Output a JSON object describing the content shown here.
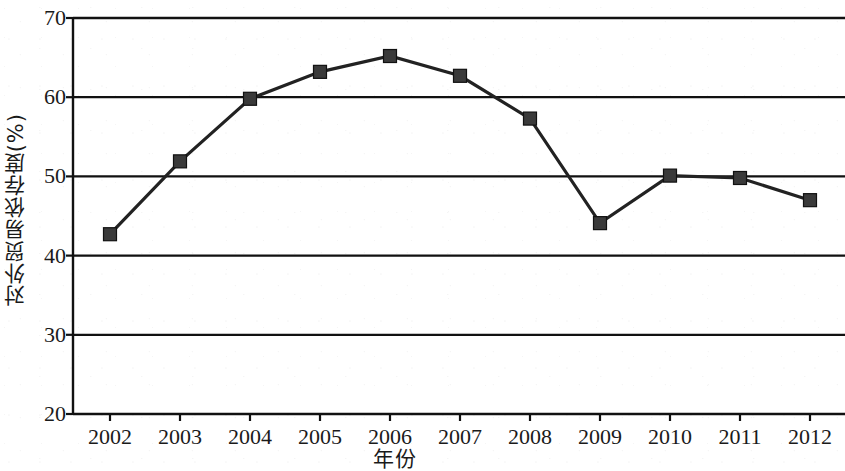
{
  "chart_data": {
    "type": "line",
    "title": "",
    "subtitle": "",
    "xlabel": "年份",
    "ylabel": "对外贸易依存度(%)",
    "categories": [
      "2002",
      "2003",
      "2004",
      "2005",
      "2006",
      "2007",
      "2008",
      "2009",
      "2010",
      "2011",
      "2012"
    ],
    "x": [
      2002,
      2003,
      2004,
      2005,
      2006,
      2007,
      2008,
      2009,
      2010,
      2011,
      2012
    ],
    "values": [
      42.7,
      51.9,
      59.8,
      63.2,
      65.2,
      62.7,
      57.3,
      44.1,
      50.1,
      49.8,
      47.0
    ],
    "series": [
      {
        "name": "对外贸易依存度",
        "values": [
          42.7,
          51.9,
          59.8,
          63.2,
          65.2,
          62.7,
          57.3,
          44.1,
          50.1,
          49.8,
          47.0
        ]
      }
    ],
    "ylim": [
      20,
      70
    ],
    "yticks": [
      20,
      30,
      40,
      50,
      60,
      70
    ],
    "ytick_labels": [
      "20",
      "30",
      "40",
      "50",
      "60",
      "70"
    ],
    "xlim": [
      2002,
      2012
    ],
    "grid": "horizontal",
    "legend": "none",
    "marker": "square",
    "line_color": "#222222",
    "marker_color": "#3a3a3a",
    "axis_color": "#111111",
    "background_color": "#ffffff"
  },
  "axis": {
    "y_title": "对外贸易依存度(%)",
    "x_title": "年份"
  }
}
